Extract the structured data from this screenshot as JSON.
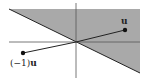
{
  "diagram": {
    "type": "half-plane with vector reflection",
    "colors": {
      "shade": "#a9a9a9",
      "line": "#222222",
      "axis": "#555555"
    },
    "labels": {
      "u": "u",
      "neg_u_prefix": "(−1)",
      "neg_u_vec": "u"
    },
    "points": {
      "u": [
        125,
        30
      ],
      "neg_u": [
        23,
        53
      ],
      "origin": [
        76,
        42
      ]
    }
  }
}
